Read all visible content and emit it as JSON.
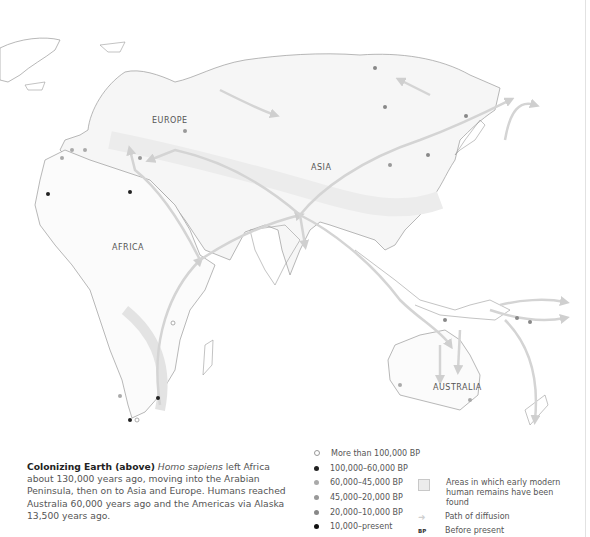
{
  "map": {
    "labels": {
      "europe": "EUROPE",
      "asia": "ASIA",
      "africa": "AFRICA",
      "australia": "AUSTRALIA"
    },
    "colors": {
      "land_outline": "#9a9a9a",
      "habitat_fill": "#e8e8e8",
      "arrow": "#d4d4d4"
    }
  },
  "caption": {
    "title": "Colonizing Earth (above)",
    "italic": "Homo sapiens",
    "body": " left Africa about 130,000 years ago, moving into the Arabian Peninsula, then on to Asia and Europe. Humans reached Australia 60,000 years ago and the Americas via Alaska 13,500 years ago."
  },
  "legend": {
    "dates": [
      {
        "label": "More than 100,000 BP",
        "color": "#ffffff",
        "border": "#999999"
      },
      {
        "label": "100,000–60,000 BP",
        "color": "#222222",
        "border": "#222222"
      },
      {
        "label": "60,000–45,000 BP",
        "color": "#aaaaaa",
        "border": "#aaaaaa"
      },
      {
        "label": "45,000–20,000 BP",
        "color": "#999999",
        "border": "#999999"
      },
      {
        "label": "20,000–10,000 BP",
        "color": "#888888",
        "border": "#888888"
      },
      {
        "label": "10,000–present",
        "color": "#111111",
        "border": "#111111"
      }
    ],
    "areas_label": "Areas in which early modern human remains have been found",
    "path_label": "Path of diffusion",
    "bp_abbrev": "BP",
    "bp_label": "Before present"
  }
}
